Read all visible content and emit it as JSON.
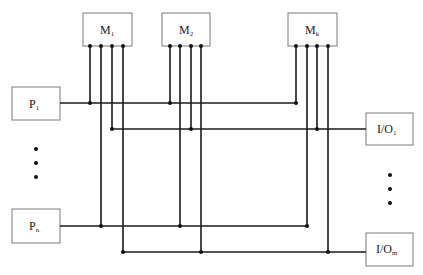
{
  "diagram": {
    "title": "",
    "memories": [
      {
        "id": "M1",
        "main": "M",
        "sub": "1"
      },
      {
        "id": "M2",
        "main": "M",
        "sub": "2"
      },
      {
        "id": "Mk",
        "main": "M",
        "sub": "k"
      }
    ],
    "processors": [
      {
        "id": "P1",
        "main": "P",
        "sub": "1"
      },
      {
        "id": "Pn",
        "main": "P",
        "sub": "n"
      }
    ],
    "io_units": [
      {
        "id": "IO1",
        "main": "I/O",
        "sub": "1"
      },
      {
        "id": "IOm",
        "main": "I/O",
        "sub": "m"
      }
    ],
    "ellipsis_left": "⋮",
    "ellipsis_right": "⋮",
    "connections": [
      {
        "from": "P1",
        "to": [
          "M1",
          "M2",
          "Mk"
        ]
      },
      {
        "from": "IO1",
        "to": [
          "M1",
          "M2",
          "Mk"
        ]
      },
      {
        "from": "Pn",
        "to": [
          "M1",
          "M2",
          "Mk"
        ]
      },
      {
        "from": "IOm",
        "to": [
          "M1",
          "M2",
          "Mk"
        ]
      }
    ],
    "colors": {
      "wire": "#1a1a1a",
      "box_border": "#7a7a7a"
    }
  }
}
